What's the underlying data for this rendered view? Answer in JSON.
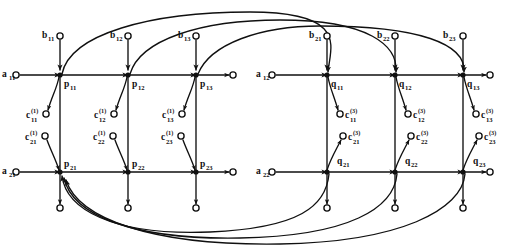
{
  "figure": {
    "type": "signal-flow-graph",
    "background_color": "#ffffff",
    "ink_color": "#101010",
    "width": 507,
    "height": 247
  },
  "blocks": [
    {
      "id": "left-block",
      "node_prefix": "p",
      "rows": [
        {
          "row": 1,
          "nodes": [
            "p",
            "p",
            "p"
          ],
          "node_labels": [
            "p11",
            "p12",
            "p13"
          ]
        },
        {
          "row": 2,
          "nodes": [
            "p",
            "p",
            "p"
          ],
          "node_labels": [
            "p21",
            "p22",
            "p23"
          ]
        }
      ]
    },
    {
      "id": "right-block",
      "node_prefix": "q",
      "rows": [
        {
          "row": 1,
          "nodes": [
            "q",
            "q",
            "q"
          ],
          "node_labels": [
            "q11",
            "q12",
            "q13"
          ]
        },
        {
          "row": 2,
          "nodes": [
            "q",
            "q",
            "q"
          ],
          "node_labels": [
            "q21",
            "q22",
            "q23"
          ]
        }
      ]
    }
  ],
  "node_labels": {
    "p11": {
      "base": "p",
      "sub": "11"
    },
    "p12": {
      "base": "p",
      "sub": "12"
    },
    "p13": {
      "base": "p",
      "sub": "13"
    },
    "p21": {
      "base": "p",
      "sub": "21"
    },
    "p22": {
      "base": "p",
      "sub": "22"
    },
    "p23": {
      "base": "p",
      "sub": "23"
    },
    "q11": {
      "base": "q",
      "sub": "11"
    },
    "q12": {
      "base": "q",
      "sub": "12"
    },
    "q13": {
      "base": "q",
      "sub": "13"
    },
    "q21": {
      "base": "q",
      "sub": "21"
    },
    "q22": {
      "base": "q",
      "sub": "22"
    },
    "q23": {
      "base": "q",
      "sub": "23"
    }
  },
  "input_labels_a": {
    "a11": {
      "base": "a",
      "sub": "11"
    },
    "a21": {
      "base": "a",
      "sub": "21"
    },
    "a12": {
      "base": "a",
      "sub": "12"
    },
    "a22": {
      "base": "a",
      "sub": "22"
    }
  },
  "input_labels_b": {
    "b11": {
      "base": "b",
      "sub": "11"
    },
    "b12": {
      "base": "b",
      "sub": "12"
    },
    "b13": {
      "base": "b",
      "sub": "13"
    },
    "b21": {
      "base": "b",
      "sub": "21"
    },
    "b22": {
      "base": "b",
      "sub": "22"
    },
    "b23": {
      "base": "b",
      "sub": "23"
    }
  },
  "labels_c_super1": {
    "c11": {
      "base": "c",
      "sup": "(1)",
      "sub": "11"
    },
    "c12": {
      "base": "c",
      "sup": "(1)",
      "sub": "12"
    },
    "c13": {
      "base": "c",
      "sup": "(1)",
      "sub": "13"
    },
    "c21": {
      "base": "c",
      "sup": "(1)",
      "sub": "21"
    },
    "c22": {
      "base": "c",
      "sup": "(1)",
      "sub": "22"
    },
    "c23": {
      "base": "c",
      "sup": "(1)",
      "sub": "23"
    }
  },
  "labels_c_super3": {
    "c11": {
      "base": "c",
      "sup": "(3)",
      "sub": "11"
    },
    "c12": {
      "base": "c",
      "sup": "(3)",
      "sub": "12"
    },
    "c13": {
      "base": "c",
      "sup": "(3)",
      "sub": "13"
    },
    "c21": {
      "base": "c",
      "sup": "(3)",
      "sub": "21"
    },
    "c22": {
      "base": "c",
      "sup": "(3)",
      "sub": "22"
    },
    "c23": {
      "base": "c",
      "sup": "(3)",
      "sub": "23"
    }
  }
}
